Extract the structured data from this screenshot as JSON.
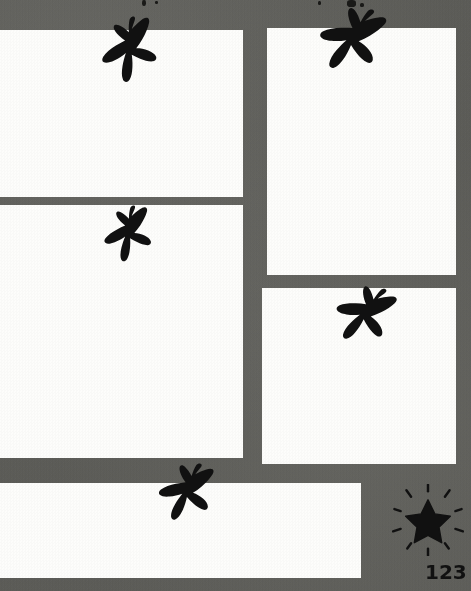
{
  "page": {
    "width": 471,
    "height": 591,
    "background_color": "#64645f",
    "panel_fill_color": "#fdfdfb",
    "ink_color": "#111111",
    "page_number": "123"
  },
  "panels": [
    {
      "name": "panel-top-left",
      "label": "Panel 1",
      "x": 0,
      "y": 30,
      "width": 243,
      "height": 167
    },
    {
      "name": "panel-middle-left",
      "label": "Panel 2",
      "x": 0,
      "y": 205,
      "width": 243,
      "height": 253
    },
    {
      "name": "panel-top-right",
      "label": "Panel 3",
      "x": 267,
      "y": 28,
      "width": 189,
      "height": 247
    },
    {
      "name": "panel-middle-right",
      "label": "Panel 4",
      "x": 262,
      "y": 288,
      "width": 194,
      "height": 176
    },
    {
      "name": "panel-bottom-wide",
      "label": "Panel 5",
      "x": 0,
      "y": 483,
      "width": 361,
      "height": 95
    }
  ],
  "birds": [
    {
      "name": "bird-silhouette-1",
      "label": "Swift in flight",
      "x": 93,
      "y": 14,
      "size": 72,
      "rotate": -12
    },
    {
      "name": "bird-silhouette-2",
      "label": "Swift in flight",
      "x": 312,
      "y": 0,
      "size": 78,
      "rotate": 18
    },
    {
      "name": "bird-silhouette-3",
      "label": "Swift in flight",
      "x": 97,
      "y": 203,
      "size": 62,
      "rotate": -8
    },
    {
      "name": "bird-silhouette-4",
      "label": "Swift in flight",
      "x": 329,
      "y": 279,
      "size": 70,
      "rotate": 22
    },
    {
      "name": "bird-silhouette-5",
      "label": "Swift in flight",
      "x": 152,
      "y": 458,
      "size": 68,
      "rotate": 8
    }
  ],
  "decorations": {
    "starburst": {
      "name": "starburst-star",
      "label": "Starburst",
      "x": 392,
      "y": 484,
      "size": 72,
      "ray_count": 10
    },
    "top_flecks": [
      {
        "x": 142,
        "y": 0,
        "w": 4,
        "h": 6
      },
      {
        "x": 155,
        "y": 1,
        "w": 3,
        "h": 3
      },
      {
        "x": 318,
        "y": 1,
        "w": 3,
        "h": 4
      },
      {
        "x": 347,
        "y": 0,
        "w": 9,
        "h": 7
      },
      {
        "x": 360,
        "y": 3,
        "w": 4,
        "h": 4
      }
    ]
  },
  "page_number_position": {
    "x": 425,
    "y": 562
  }
}
